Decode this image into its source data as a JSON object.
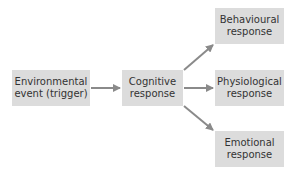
{
  "diagram": {
    "nodes": {
      "environmental": {
        "line1": "Environmental",
        "line2": "event (trigger)"
      },
      "cognitive": {
        "line1": "Cognitive",
        "line2": "response"
      },
      "behavioural": {
        "line1": "Behavioural",
        "line2": "response"
      },
      "physiological": {
        "line1": "Physiological",
        "line2": "response"
      },
      "emotional": {
        "line1": "Emotional",
        "line2": "response"
      }
    },
    "edges": [
      {
        "from": "environmental",
        "to": "cognitive"
      },
      {
        "from": "cognitive",
        "to": "behavioural"
      },
      {
        "from": "cognitive",
        "to": "physiological"
      },
      {
        "from": "cognitive",
        "to": "emotional"
      }
    ],
    "colors": {
      "box_fill": "#dcdcdc",
      "arrow": "#8a8a8a",
      "text": "#333333"
    }
  }
}
